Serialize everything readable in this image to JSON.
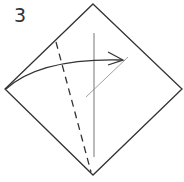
{
  "diagram": {
    "step_number": "3",
    "type": "origami-fold-instruction",
    "colors": {
      "outline": "#333333",
      "crease": "#555555",
      "thin_line": "#888888"
    }
  }
}
